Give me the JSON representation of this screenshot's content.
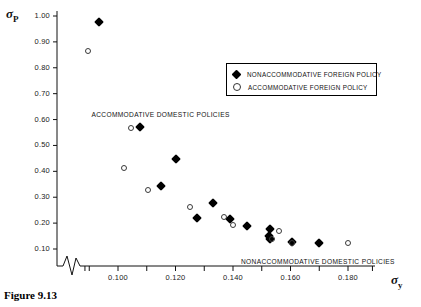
{
  "figure": {
    "caption": "Figure 9.13",
    "y_axis_symbol": "σ",
    "y_axis_subscript": "P",
    "x_axis_symbol": "σ",
    "x_axis_subscript": "y"
  },
  "legend": {
    "entries": [
      {
        "marker": "filled-diamond-icon",
        "label": "NONACCOMMODATIVE FOREIGN POLICY"
      },
      {
        "marker": "open-circle-icon",
        "label": "ACCOMMODATIVE FOREIGN POLICY"
      }
    ]
  },
  "annotations": [
    {
      "text": "ACCOMMODATIVE DOMESTIC POLICIES",
      "x": 0.1005,
      "y": 0.615
    },
    {
      "text": "NONACCOMMODATIVE DOMESTIC POLICIES",
      "x": 0.1525,
      "y": 0.045
    }
  ],
  "chart_data": {
    "type": "scatter",
    "title": "",
    "xlabel": "σy",
    "ylabel": "σP",
    "xlim": [
      0.088,
      0.189
    ],
    "ylim": [
      0.0,
      1.02
    ],
    "x_ticks": [
      0.1,
      0.12,
      0.14,
      0.16,
      0.18
    ],
    "x_tick_labels": [
      "0.100",
      "0.120",
      "0.140",
      "0.160",
      "0.180"
    ],
    "x_minor_ticks": [
      0.09,
      0.11,
      0.13,
      0.15,
      0.17
    ],
    "y_ticks": [
      0.1,
      0.2,
      0.3,
      0.4,
      0.5,
      0.6,
      0.7,
      0.8,
      0.9,
      1.0
    ],
    "y_tick_labels": [
      "0.10",
      "0.20",
      "0.30",
      "0.40",
      "0.50",
      "0.60",
      "0.70",
      "0.80",
      "0.90",
      "1.00"
    ],
    "grid": false,
    "axis_break": {
      "axis": "x",
      "style": "zigzag",
      "note": "broken x-axis near origin"
    },
    "legend_position": "upper-right",
    "series": [
      {
        "name": "NONACCOMMODATIVE FOREIGN POLICY",
        "marker": "filled-diamond",
        "color": "#000000",
        "points": [
          {
            "x": 0.0935,
            "y": 0.975
          },
          {
            "x": 0.1075,
            "y": 0.57
          },
          {
            "x": 0.12,
            "y": 0.448
          },
          {
            "x": 0.115,
            "y": 0.342
          },
          {
            "x": 0.133,
            "y": 0.278
          },
          {
            "x": 0.1275,
            "y": 0.218
          },
          {
            "x": 0.139,
            "y": 0.215
          },
          {
            "x": 0.145,
            "y": 0.19
          },
          {
            "x": 0.153,
            "y": 0.178
          },
          {
            "x": 0.1525,
            "y": 0.152
          },
          {
            "x": 0.153,
            "y": 0.14
          },
          {
            "x": 0.1605,
            "y": 0.128
          },
          {
            "x": 0.17,
            "y": 0.125
          }
        ]
      },
      {
        "name": "ACCOMMODATIVE FOREIGN POLICY",
        "marker": "open-circle",
        "color": "#ffffff",
        "points": [
          {
            "x": 0.0895,
            "y": 0.865
          },
          {
            "x": 0.1045,
            "y": 0.568
          },
          {
            "x": 0.102,
            "y": 0.412
          },
          {
            "x": 0.1105,
            "y": 0.328
          },
          {
            "x": 0.125,
            "y": 0.262
          },
          {
            "x": 0.137,
            "y": 0.222
          },
          {
            "x": 0.14,
            "y": 0.192
          },
          {
            "x": 0.156,
            "y": 0.168
          },
          {
            "x": 0.1535,
            "y": 0.14
          },
          {
            "x": 0.1605,
            "y": 0.122
          },
          {
            "x": 0.18,
            "y": 0.122
          }
        ]
      }
    ]
  }
}
